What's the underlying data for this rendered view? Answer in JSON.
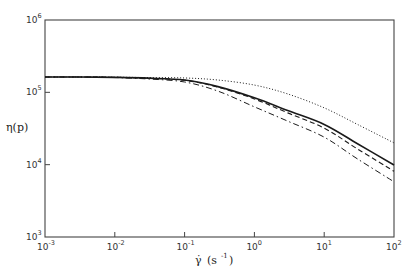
{
  "chart_data": {
    "type": "line",
    "title": "",
    "xlabel": "γ̇ (s⁻¹)",
    "ylabel": "η(p)",
    "xscale": "log",
    "yscale": "log",
    "xlim": [
      0.001,
      100
    ],
    "ylim": [
      1000,
      1000000
    ],
    "grid": false,
    "legend": null,
    "x_ticks": [
      {
        "base": "10",
        "exp": "-3",
        "value": 0.001
      },
      {
        "base": "10",
        "exp": "-2",
        "value": 0.01
      },
      {
        "base": "10",
        "exp": "-1",
        "value": 0.1
      },
      {
        "base": "10",
        "exp": "0",
        "value": 1
      },
      {
        "base": "10",
        "exp": "1",
        "value": 10
      },
      {
        "base": "10",
        "exp": "2",
        "value": 100
      }
    ],
    "y_ticks": [
      {
        "base": "10",
        "exp": "3",
        "value": 1000
      },
      {
        "base": "10",
        "exp": "4",
        "value": 10000
      },
      {
        "base": "10",
        "exp": "5",
        "value": 100000
      },
      {
        "base": "10",
        "exp": "6",
        "value": 1000000
      }
    ],
    "x": [
      0.001,
      0.003,
      0.01,
      0.03,
      0.1,
      0.3,
      1,
      3,
      10,
      30,
      100
    ],
    "series": [
      {
        "name": "dotted",
        "style": "dotted",
        "values": [
          163000,
          163000,
          162000,
          160000,
          158000,
          148000,
          126000,
          95000,
          61000,
          36000,
          20000
        ]
      },
      {
        "name": "solid",
        "style": "solid",
        "values": [
          163000,
          163000,
          161000,
          157000,
          148000,
          120000,
          84000,
          56000,
          36000,
          19500,
          9900
        ]
      },
      {
        "name": "dashed",
        "style": "dashed",
        "values": [
          163000,
          163000,
          161000,
          156000,
          147000,
          118000,
          81000,
          52000,
          32000,
          16500,
          8100
        ]
      },
      {
        "name": "dash-dot",
        "style": "dashdot",
        "values": [
          163000,
          163000,
          160000,
          153000,
          139000,
          104000,
          63000,
          40000,
          24000,
          12000,
          5800
        ]
      }
    ]
  },
  "labels": {
    "ylabel_text": "η(p)",
    "xlabel_gamma": "γ̇",
    "xlabel_units": "(s",
    "xlabel_exp": "-1",
    "xlabel_close": ")"
  }
}
